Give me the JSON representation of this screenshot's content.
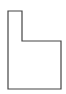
{
  "diagram": {
    "type": "outline-shape",
    "shape": "L-shaped polygon",
    "stroke_color": "#444444",
    "fill_color": "#ffffff",
    "points": [
      [
        8,
        11
      ],
      [
        22,
        11
      ],
      [
        22,
        41
      ],
      [
        61,
        41
      ],
      [
        61,
        89
      ],
      [
        8,
        89
      ]
    ]
  }
}
